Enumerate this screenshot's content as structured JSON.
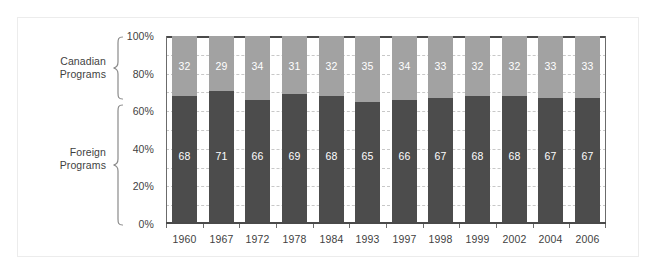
{
  "chart_data": {
    "type": "bar",
    "stacked": true,
    "percent": true,
    "title": "",
    "subtitle": "",
    "xlabel": "",
    "ylabel": "",
    "ylim": [
      0,
      100
    ],
    "ytick_labels": [
      "0%",
      "20%",
      "40%",
      "60%",
      "80%",
      "100%"
    ],
    "ytick_values": [
      0,
      20,
      40,
      60,
      80,
      100
    ],
    "gridlines": [
      10,
      20,
      30,
      40,
      50,
      60,
      70,
      80,
      90
    ],
    "grid": true,
    "legend_position": "left-brackets",
    "categories": [
      "1960",
      "1967",
      "1972",
      "1978",
      "1984",
      "1993",
      "1997",
      "1998",
      "1999",
      "2002",
      "2004",
      "2006"
    ],
    "series": [
      {
        "name": "Foreign Programs",
        "color": "#4c4c4c",
        "values": [
          68,
          71,
          66,
          69,
          68,
          65,
          66,
          67,
          68,
          68,
          67,
          67
        ]
      },
      {
        "name": "Canadian Programs",
        "color": "#a2a2a2",
        "values": [
          32,
          29,
          34,
          31,
          32,
          35,
          34,
          33,
          32,
          32,
          33,
          33
        ]
      }
    ],
    "annotations": {
      "bracket_top_label": "Canadian\nPrograms",
      "bracket_bottom_label": "Foreign\nPrograms"
    }
  },
  "axis": {
    "y_ticks": [
      {
        "label": "100%",
        "value": 100
      },
      {
        "label": "80%",
        "value": 80
      },
      {
        "label": "60%",
        "value": 60
      },
      {
        "label": "40%",
        "value": 40
      },
      {
        "label": "20%",
        "value": 20
      },
      {
        "label": "0%",
        "value": 0
      }
    ],
    "x_labels": [
      "1960",
      "1967",
      "1972",
      "1978",
      "1984",
      "1993",
      "1997",
      "1998",
      "1999",
      "2002",
      "2004",
      "2006"
    ]
  },
  "brackets": {
    "canadian": {
      "line1": "Canadian",
      "line2": "Programs"
    },
    "foreign": {
      "line1": "Foreign",
      "line2": "Programs"
    }
  },
  "colors": {
    "series_top": "#a2a2a2",
    "series_bottom": "#4c4c4c",
    "axis": "#4a4a4a",
    "grid": "#c8c8c8",
    "text": "#3f3f3f",
    "value_text": "#ffffff",
    "frame": "#ececec",
    "background": "#ffffff"
  }
}
